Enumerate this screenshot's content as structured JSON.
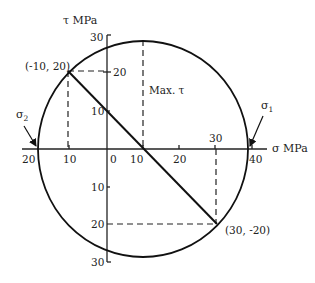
{
  "diagram": {
    "type": "mohr-circle",
    "axes": {
      "sigma_label": "σ MPa",
      "tau_label": "τ MPa",
      "sigma_ticks": [
        "20",
        "10",
        "0",
        "10",
        "20",
        "30",
        "40"
      ],
      "tau_ticks_upper": [
        "30",
        "20",
        "10"
      ],
      "tau_ticks_lower": [
        "10",
        "20",
        "30"
      ]
    },
    "points": {
      "A": {
        "label": "(-10, 20)",
        "sigma": -10,
        "tau": 20
      },
      "B": {
        "label": "(30, -20)",
        "sigma": 30,
        "tau": -20
      }
    },
    "center_sigma": 10,
    "radius": 28.3,
    "annotations": {
      "max_tau": "Max. τ",
      "sigma1": "σ",
      "sigma1_sub": "1",
      "sigma2": "σ",
      "sigma2_sub": "2"
    }
  }
}
